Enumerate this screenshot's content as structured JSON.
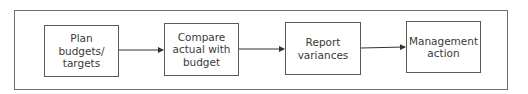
{
  "diagram": {
    "type": "flowchart",
    "direction": "left-to-right",
    "nodes": [
      {
        "id": "plan",
        "label": "Plan\nbudgets/\ntargets"
      },
      {
        "id": "compare",
        "label": "Compare\nactual with\nbudget"
      },
      {
        "id": "report",
        "label": "Report\nvariances"
      },
      {
        "id": "action",
        "label": "Management\naction"
      }
    ],
    "edges": [
      {
        "from": "plan",
        "to": "compare"
      },
      {
        "from": "compare",
        "to": "report"
      },
      {
        "from": "report",
        "to": "action"
      }
    ]
  },
  "colors": {
    "frame": "#6f6f6f",
    "box_border": "#5a5a5a",
    "text": "#3a3a3a",
    "arrow": "#333333"
  }
}
